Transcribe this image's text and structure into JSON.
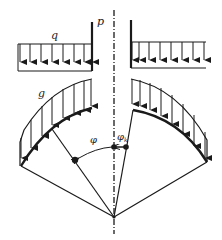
{
  "diagram": {
    "labels": {
      "q": "q",
      "p": "p",
      "g": "g",
      "phi": "φ",
      "phi_k": "φ",
      "phi_k_sub": "k"
    },
    "colors": {
      "stroke": "#1a1a1a",
      "background": "#ffffff"
    }
  }
}
